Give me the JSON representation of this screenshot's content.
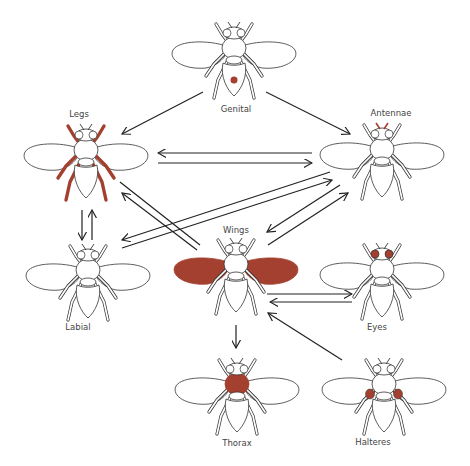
{
  "diagram": {
    "type": "directed-graph",
    "highlight_color": "#a3402f",
    "nodes": [
      {
        "id": "genital",
        "label": "Genital",
        "highlight": "genital"
      },
      {
        "id": "legs",
        "label": "Legs",
        "highlight": "legs"
      },
      {
        "id": "antennae",
        "label": "Antennae",
        "highlight": "antennae"
      },
      {
        "id": "labial",
        "label": "Labial",
        "highlight": "labial"
      },
      {
        "id": "wings",
        "label": "Wings",
        "highlight": "wings"
      },
      {
        "id": "eyes",
        "label": "Eyes",
        "highlight": "eyes"
      },
      {
        "id": "thorax",
        "label": "Thorax",
        "highlight": "thorax"
      },
      {
        "id": "halteres",
        "label": "Halteres",
        "highlight": "halteres"
      }
    ],
    "edges": [
      {
        "from": "Genital",
        "to": "Legs"
      },
      {
        "from": "Genital",
        "to": "Antennae"
      },
      {
        "from": "Antennae",
        "to": "Legs"
      },
      {
        "from": "Legs",
        "to": "Antennae"
      },
      {
        "from": "Legs",
        "to": "Wings"
      },
      {
        "from": "Wings",
        "to": "Legs"
      },
      {
        "from": "Antennae",
        "to": "Labial"
      },
      {
        "from": "Labial",
        "to": "Antennae"
      },
      {
        "from": "Antennae",
        "to": "Wings"
      },
      {
        "from": "Wings",
        "to": "Antennae"
      },
      {
        "from": "Legs",
        "to": "Labial"
      },
      {
        "from": "Labial",
        "to": "Legs"
      },
      {
        "from": "Wings",
        "to": "Eyes"
      },
      {
        "from": "Eyes",
        "to": "Wings"
      },
      {
        "from": "Halteres",
        "to": "Wings"
      },
      {
        "from": "Wings",
        "to": "Thorax"
      }
    ]
  }
}
